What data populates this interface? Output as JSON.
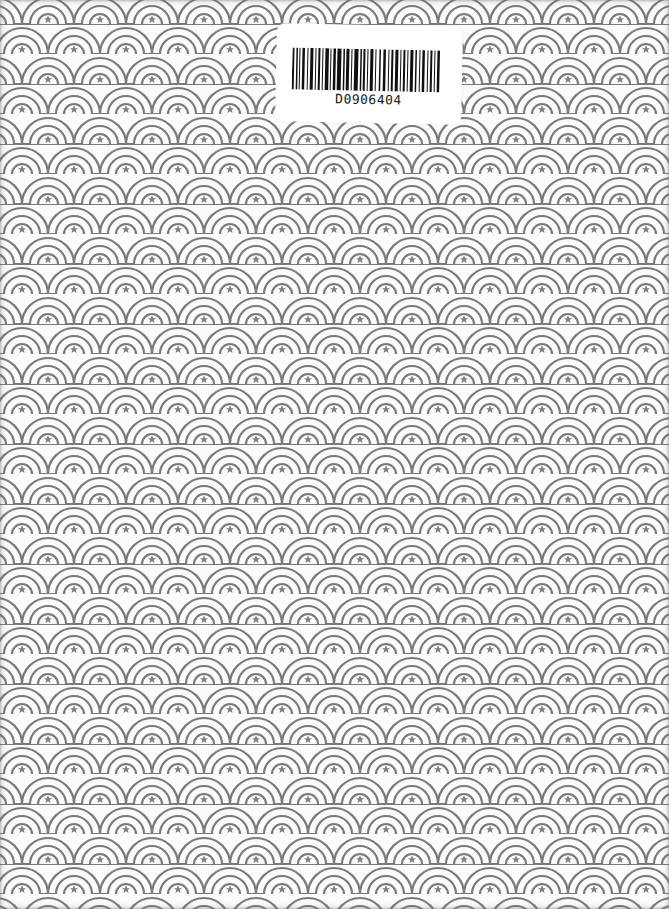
{
  "cover": {
    "pattern": {
      "name": "seigaiha-star-scales",
      "stroke_color": "#7a7a7a",
      "background_color": "#fbfbfb",
      "star_color": "#808080",
      "tile_width": 52,
      "tile_height": 30
    },
    "barcode_label": {
      "code": "D0906404",
      "bar_color": "#111111",
      "sticker_color": "#ffffff"
    }
  }
}
